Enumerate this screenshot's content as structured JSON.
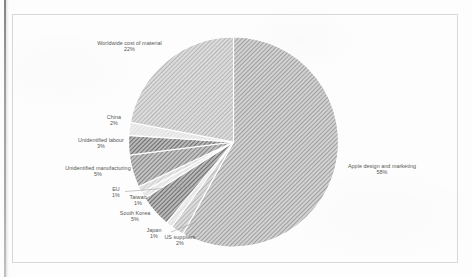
{
  "chart_data": {
    "type": "pie",
    "title": "",
    "subtitle": "",
    "legend_position": "none",
    "labels_outside": true,
    "start_angle_deg": 0,
    "direction": "clockwise",
    "categories": [
      "Apple design and marketing",
      "US suppliers",
      "Japan",
      "South Korea",
      "Taiwan",
      "EU",
      "Unidentified manufacturing",
      "Unidentified labour",
      "China",
      "Worldwide cost of material"
    ],
    "values": [
      58,
      2,
      1,
      5,
      1,
      1,
      5,
      3,
      2,
      22
    ],
    "value_unit": "%",
    "slices": [
      {
        "label": "Apple design and marketing",
        "percent": "58%",
        "value": 58,
        "fill": "#b0b0b0"
      },
      {
        "label": "US suppliers",
        "percent": "2%",
        "value": 2,
        "fill": "#cfcfcf"
      },
      {
        "label": "Japan",
        "percent": "1%",
        "value": 1,
        "fill": "#dcdcdc"
      },
      {
        "label": "South Korea",
        "percent": "5%",
        "value": 5,
        "fill": "#888888"
      },
      {
        "label": "Taiwan",
        "percent": "1%",
        "value": 1,
        "fill": "#e2e2e2"
      },
      {
        "label": "EU",
        "percent": "1%",
        "value": 1,
        "fill": "#c8c8c8"
      },
      {
        "label": "Unidentified manufacturing",
        "percent": "5%",
        "value": 5,
        "fill": "#a8a8a8"
      },
      {
        "label": "Unidentified labour",
        "percent": "3%",
        "value": 3,
        "fill": "#8f8f8f"
      },
      {
        "label": "China",
        "percent": "2%",
        "value": 2,
        "fill": "#dddddd"
      },
      {
        "label": "Worldwide cost of material",
        "percent": "22%",
        "value": 22,
        "fill": "#bdbdbd"
      }
    ]
  },
  "labels": {
    "worldwide_name": "Worldwide cost of material",
    "worldwide_pct": "22%",
    "china_name": "China",
    "china_pct": "2%",
    "unid_labour_name": "Unidentified labour",
    "unid_labour_pct": "3%",
    "unid_manu_name": "Unidentified manufacturing",
    "unid_manu_pct": "5%",
    "eu_name": "EU",
    "eu_pct": "1%",
    "taiwan_name": "Taiwan",
    "taiwan_pct": "1%",
    "skorea_name": "South Korea",
    "skorea_pct": "5%",
    "japan_name": "Japan",
    "japan_pct": "1%",
    "us_name": "US suppliers",
    "us_pct": "2%",
    "apple_name": "Apple design and marketing",
    "apple_pct": "58%"
  },
  "colors": {
    "border": "#d8d8d8",
    "text": "#4a4a4a",
    "slice_separator": "#ffffff",
    "page_edge": "#6f6f6f"
  }
}
